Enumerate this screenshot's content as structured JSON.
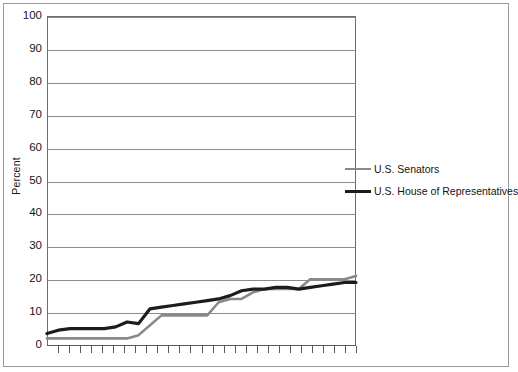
{
  "figure": {
    "axis_title": "Percent"
  },
  "legend": {
    "items": [
      {
        "label": "U.S. Senators",
        "color": "#898989",
        "key": "senators"
      },
      {
        "label": "U.S. House of Representatives",
        "color": "#1c1c1c",
        "key": "house"
      }
    ]
  },
  "chart_data": {
    "type": "line",
    "title": "",
    "xlabel": "",
    "ylabel": "Percent",
    "ylim": [
      0,
      100
    ],
    "ytick_labels": [
      "100",
      "90",
      "80",
      "70",
      "60",
      "50",
      "40",
      "30",
      "20",
      "10",
      "0"
    ],
    "yticks": [
      100,
      90,
      80,
      70,
      60,
      50,
      40,
      30,
      20,
      10,
      0
    ],
    "grid": "horizontal",
    "legend_position": "center-right",
    "x_tick_count": 28,
    "x_tick_labels": [],
    "series": [
      {
        "name": "U.S. Senators",
        "color": "#898989",
        "values": [
          2,
          2,
          2,
          2,
          2,
          2,
          2,
          2,
          3,
          6,
          9,
          9,
          9,
          9,
          9,
          13,
          14,
          14,
          16,
          17,
          17,
          17,
          17,
          20,
          20,
          20,
          20,
          21
        ]
      },
      {
        "name": "U.S. House of Representatives",
        "color": "#1c1c1c",
        "values": [
          3.5,
          4.5,
          5,
          5,
          5,
          5,
          5.5,
          7,
          6.5,
          11,
          11.5,
          12,
          12.5,
          13,
          13.5,
          14,
          15,
          16.5,
          17,
          17,
          17.5,
          17.5,
          17,
          17.5,
          18,
          18.5,
          19,
          19
        ]
      }
    ]
  }
}
